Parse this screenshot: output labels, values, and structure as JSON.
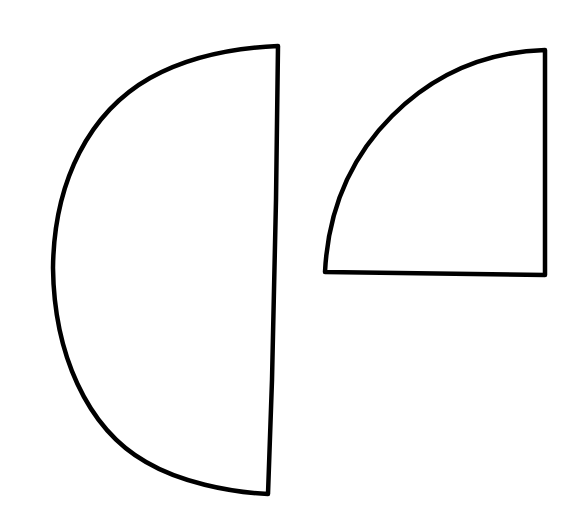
{
  "diagram": {
    "background": "#ffffff",
    "stroke_color": "#000000",
    "shapes": [
      {
        "name": "semicircle",
        "description": "Half circle with straight edge on the right",
        "path": "M 278 46 L 276 200 L 272 380 L 268 494 C 228 492 180 482 146 462 C 86 428 54 352 53 268 C 54 180 90 112 150 78 C 186 58 230 48 278 46 Z"
      },
      {
        "name": "quarter-circle",
        "description": "Quarter circle with right angle at bottom-right",
        "path": "M 545 50 L 545 275 L 325 272 C 328 212 350 158 392 116 C 430 78 480 52 545 50 Z"
      }
    ]
  }
}
